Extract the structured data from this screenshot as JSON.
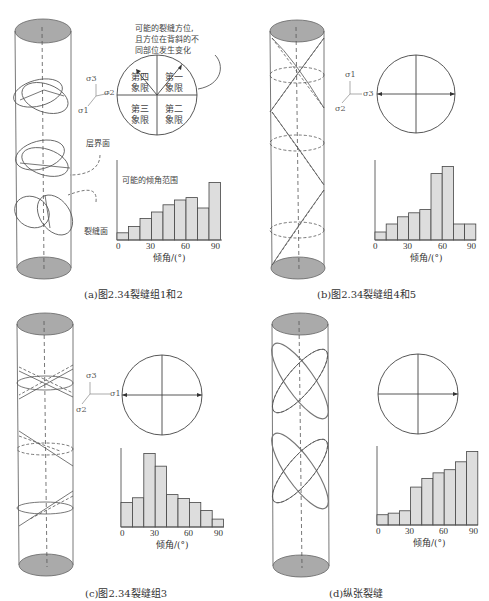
{
  "figure": {
    "panels": [
      {
        "id": "a",
        "caption": "(a)图2.34裂缝组1和2",
        "stress_axes": {
          "s_up": "σ3",
          "s_right": "σ2",
          "s_down": "σ1"
        },
        "labels": {
          "orientation_note_1": "可能的裂缝方位,",
          "orientation_note_2": "且方位在背斜的不",
          "orientation_note_3": "同部位发生变化",
          "bedding_plane": "层界面",
          "fracture_plane": "裂缝面",
          "dip_range": "可能的倾角范围"
        },
        "quadrants": {
          "q4": "第四\n象限",
          "q1": "第一\n象限",
          "q3": "第三\n象限",
          "q2": "第二\n象限"
        }
      },
      {
        "id": "b",
        "caption": "(b)图2.34裂缝组4和5",
        "stress_axes": {
          "s_up": "σ1",
          "s_right": "σ3",
          "s_down": "σ2"
        }
      },
      {
        "id": "c",
        "caption": "(c)图2.34裂缝组3",
        "stress_axes": {
          "s_up": "σ3",
          "s_right": "σ1",
          "s_down": "σ2"
        }
      },
      {
        "id": "d",
        "caption": "(d)纵张裂缝"
      }
    ]
  },
  "chart_data": [
    {
      "type": "bar",
      "panel": "a",
      "title": "可能的倾角范围",
      "xlabel": "倾角/(°)",
      "ylabel": "",
      "x_ticks": [
        "0",
        "30",
        "60",
        "90"
      ],
      "categories": [
        "0-10",
        "10-20",
        "20-30",
        "30-40",
        "40-50",
        "50-60",
        "60-70",
        "70-80",
        "80-90"
      ],
      "values": [
        9,
        17,
        27,
        35,
        44,
        50,
        53,
        40,
        72
      ],
      "ylim": [
        0,
        100
      ],
      "grid": false
    },
    {
      "type": "bar",
      "panel": "b",
      "title": "",
      "xlabel": "倾角/(°)",
      "ylabel": "",
      "x_ticks": [
        "0",
        "30",
        "60",
        "90"
      ],
      "categories": [
        "0-10",
        "10-20",
        "20-30",
        "30-40",
        "40-50",
        "50-60",
        "60-70",
        "70-80",
        "80-90"
      ],
      "values": [
        10,
        20,
        29,
        34,
        38,
        83,
        92,
        20,
        20
      ],
      "ylim": [
        0,
        100
      ],
      "grid": false
    },
    {
      "type": "bar",
      "panel": "c",
      "title": "",
      "xlabel": "倾角/(°)",
      "ylabel": "",
      "x_ticks": [
        "0",
        "30",
        "60",
        "90"
      ],
      "categories": [
        "0-10",
        "10-20",
        "20-30",
        "30-40",
        "40-50",
        "50-60",
        "60-70",
        "70-80",
        "80-90"
      ],
      "values": [
        31,
        37,
        93,
        77,
        41,
        36,
        31,
        21,
        10
      ],
      "ylim": [
        0,
        100
      ],
      "grid": false
    },
    {
      "type": "bar",
      "panel": "d",
      "title": "",
      "xlabel": "倾角/(°)",
      "ylabel": "",
      "x_ticks": [
        "0",
        "30",
        "60",
        "90"
      ],
      "categories": [
        "0-10",
        "10-20",
        "20-30",
        "30-40",
        "40-50",
        "50-60",
        "60-70",
        "70-80",
        "80-90"
      ],
      "values": [
        13,
        15,
        18,
        48,
        59,
        66,
        70,
        80,
        93
      ],
      "ylim": [
        0,
        100
      ],
      "grid": false
    }
  ]
}
